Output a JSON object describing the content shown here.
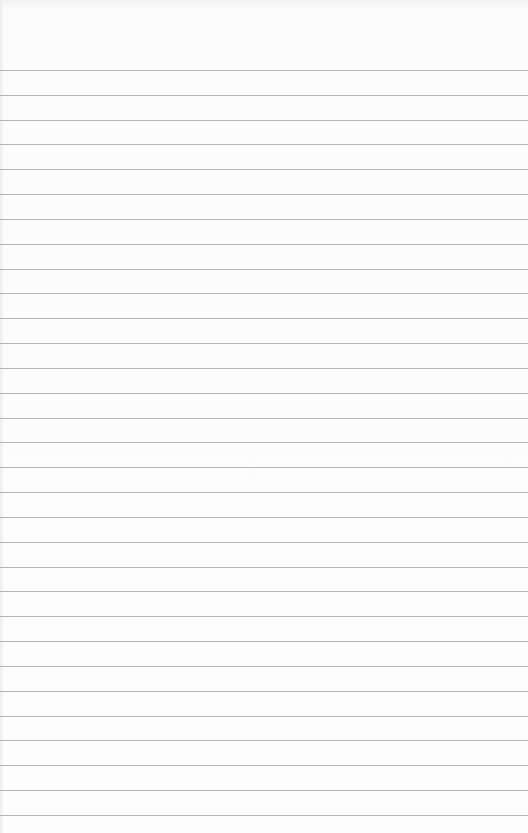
{
  "page": {
    "type": "blank lined notebook paper",
    "line_count": 31,
    "first_line_y": 70,
    "line_spacing": 24.83,
    "line_color": "#a8a8a8",
    "paper_color": "#fdfdfd"
  }
}
